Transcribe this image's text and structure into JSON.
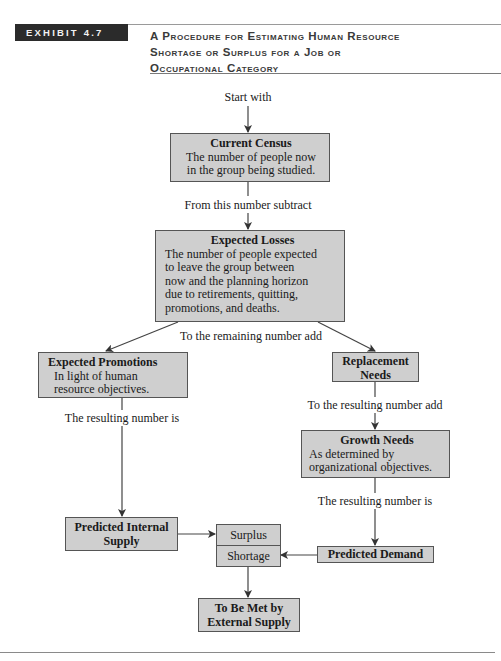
{
  "header": {
    "exhibit_label": "EXHIBIT 4.7",
    "title_lines": [
      "A Procedure for Estimating Human Resource",
      "Shortage or Surplus for a Job or",
      "Occupational Category"
    ]
  },
  "flow": {
    "start_label": "Start with",
    "current_census": {
      "title": "Current Census",
      "body": [
        "The number of people now",
        "in the group being studied."
      ]
    },
    "subtract_label": "From this number subtract",
    "expected_losses": {
      "title": "Expected Losses",
      "body": [
        "The number of people expected",
        "to leave the group between",
        "now and the planning horizon",
        "due to retirements, quitting,",
        "promotions, and deaths."
      ]
    },
    "remaining_add_label": "To the remaining number add",
    "expected_promotions": {
      "title": "Expected Promotions",
      "body": [
        "In light of human",
        "resource objectives."
      ]
    },
    "replacement_needs": {
      "title_lines": [
        "Replacement",
        "Needs"
      ]
    },
    "resulting_add_label": "To the resulting number add",
    "growth_needs": {
      "title": "Growth Needs",
      "body": [
        "As determined by",
        "organizational objectives."
      ]
    },
    "left_resulting_label": "The resulting number is",
    "right_resulting_label": "The resulting number is",
    "predicted_internal_supply": {
      "title_lines": [
        "Predicted Internal",
        "Supply"
      ]
    },
    "surplus_label": "Surplus",
    "shortage_label": "Shortage",
    "predicted_demand": {
      "title": "Predicted Demand"
    },
    "external_supply": {
      "title_lines": [
        "To Be Met by",
        "External Supply"
      ]
    }
  }
}
